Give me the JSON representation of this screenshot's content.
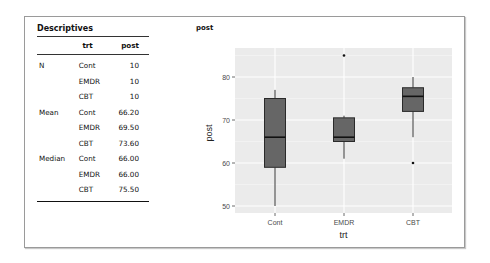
{
  "descriptives": {
    "title": "Descriptives",
    "columns": [
      "",
      "trt",
      "post"
    ],
    "rows": [
      {
        "stat": "N",
        "trt": "Cont",
        "value": "10"
      },
      {
        "stat": "",
        "trt": "EMDR",
        "value": "10"
      },
      {
        "stat": "",
        "trt": "CBT",
        "value": "10"
      },
      {
        "stat": "Mean",
        "trt": "Cont",
        "value": "66.20"
      },
      {
        "stat": "",
        "trt": "EMDR",
        "value": "69.50"
      },
      {
        "stat": "",
        "trt": "CBT",
        "value": "73.60"
      },
      {
        "stat": "Median",
        "trt": "Cont",
        "value": "66.00"
      },
      {
        "stat": "",
        "trt": "EMDR",
        "value": "66.00"
      },
      {
        "stat": "",
        "trt": "CBT",
        "value": "75.50"
      }
    ]
  },
  "plot": {
    "title": "post"
  },
  "chart_data": {
    "type": "boxplot",
    "title": "post",
    "xlabel": "trt",
    "ylabel": "post",
    "categories": [
      "Cont",
      "EMDR",
      "CBT"
    ],
    "yticks": [
      50,
      60,
      70,
      80
    ],
    "ylim": [
      48.5,
      87
    ],
    "grid": true,
    "panel_background": "#ebebeb",
    "box_fill": "#666666",
    "boxes": [
      {
        "name": "Cont",
        "whisker_low": 50,
        "q1": 59,
        "median": 66,
        "q3": 75,
        "whisker_high": 77,
        "outliers": []
      },
      {
        "name": "EMDR",
        "whisker_low": 61,
        "q1": 65,
        "median": 66,
        "q3": 70.5,
        "whisker_high": 71,
        "outliers": [
          85
        ]
      },
      {
        "name": "CBT",
        "whisker_low": 66,
        "q1": 72,
        "median": 75.5,
        "q3": 77.5,
        "whisker_high": 80,
        "outliers": [
          60
        ]
      }
    ]
  }
}
